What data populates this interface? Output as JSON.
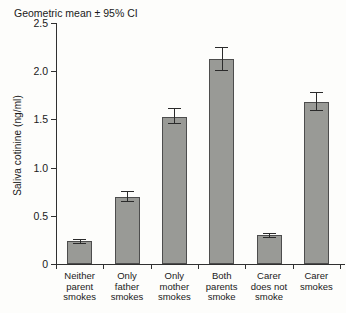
{
  "chart_data": {
    "type": "bar",
    "title": "",
    "annotation": "Geometric mean ± 95% CI",
    "xlabel": "",
    "ylabel": "Saliva cotinine (ng/ml)",
    "ylim": [
      0,
      2.5
    ],
    "grid": false,
    "legend": null,
    "yticks": [
      "0",
      "0.5",
      "1.0",
      "1.5",
      "2.0",
      "2.5"
    ],
    "ytick_values": [
      0,
      0.5,
      1.0,
      1.5,
      2.0,
      2.5
    ],
    "categories": [
      "Neither parent smokes",
      "Only father smokes",
      "Only mother smokes",
      "Both parents smoke",
      "Carer does not smoke",
      "Carer smokes"
    ],
    "category_lines": [
      [
        "Neither",
        "parent",
        "smokes"
      ],
      [
        "Only",
        "father",
        "smokes"
      ],
      [
        "Only",
        "mother",
        "smokes"
      ],
      [
        "Both",
        "parents",
        "smoke"
      ],
      [
        "Carer",
        "does not",
        "smoke"
      ],
      [
        "Carer",
        "smokes"
      ]
    ],
    "values": [
      0.24,
      0.7,
      1.53,
      2.13,
      0.3,
      1.68
    ],
    "ci_lower": [
      0.22,
      0.65,
      1.46,
      2.01,
      0.28,
      1.6
    ],
    "ci_upper": [
      0.26,
      0.76,
      1.62,
      2.25,
      0.32,
      1.78
    ],
    "series": [
      {
        "name": "Saliva cotinine",
        "values": [
          0.24,
          0.7,
          1.53,
          2.13,
          0.3,
          1.68
        ]
      }
    ],
    "bar_color": "#999a96",
    "bar_edge_color": "#4d4d4d",
    "axis_color": "#303030"
  }
}
